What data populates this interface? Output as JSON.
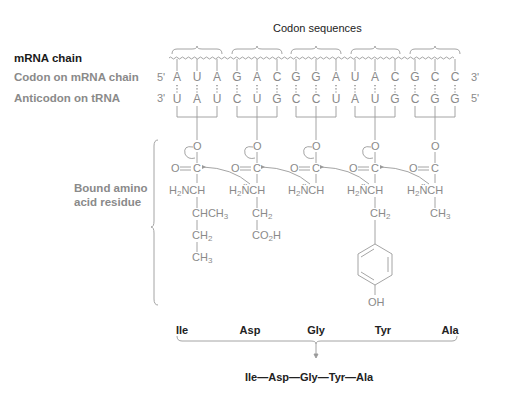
{
  "header": {
    "codon_title": "Codon sequences"
  },
  "row_labels": {
    "mrna_chain": "mRNA chain",
    "codon_on_mrna": "Codon on mRNA chain",
    "anticodon_on_trna": "Anticodon on tRNA",
    "bound_residue_line1": "Bound amino",
    "bound_residue_line2": "acid residue"
  },
  "strand_ends": {
    "mrna_left": "5'",
    "mrna_right": "3'",
    "trna_left": "3'",
    "trna_right": "5'"
  },
  "codons": [
    "AUA",
    "GAC",
    "GGA",
    "UAC",
    "GCC"
  ],
  "mrna_bases": [
    "A",
    "U",
    "A",
    "G",
    "A",
    "C",
    "G",
    "G",
    "A",
    "U",
    "A",
    "C",
    "G",
    "C",
    "C"
  ],
  "trna_bases": [
    "U",
    "A",
    "U",
    "C",
    "U",
    "G",
    "C",
    "C",
    "U",
    "A",
    "U",
    "G",
    "C",
    "G",
    "G"
  ],
  "residues": [
    {
      "name": "Ile",
      "carbonyl": "O═C",
      "alpha": "H2NCH",
      "side_chain": [
        "CHCH3",
        "CH2",
        "CH3"
      ]
    },
    {
      "name": "Asp",
      "carbonyl": "O═C",
      "alpha": "H2N̈CH",
      "side_chain": [
        "CH2",
        "CO2H"
      ]
    },
    {
      "name": "Gly",
      "carbonyl": "O═C",
      "alpha": "H2N̈CH",
      "side_chain": []
    },
    {
      "name": "Tyr",
      "carbonyl": "O═C",
      "alpha": "H2N̈CH",
      "side_chain": [
        "CH2",
        "phenol-ring",
        "OH"
      ]
    },
    {
      "name": "Ala",
      "carbonyl": "O═C",
      "alpha": "H2N̈CH",
      "side_chain": [
        "CH3"
      ]
    }
  ],
  "amino_acid_labels": [
    "Ile",
    "Asp",
    "Gly",
    "Tyr",
    "Ala"
  ],
  "peptide": {
    "sequence": [
      "Ile",
      "Asp",
      "Gly",
      "Tyr",
      "Ala"
    ],
    "text": "Ile—Asp—Gly—Tyr—Ala"
  },
  "chem_text": {
    "oxygen": "O",
    "carbon": "C",
    "oh": "OH"
  },
  "colors": {
    "line_grey": "#9a9a9a",
    "text_grey": "#8a8a8a",
    "text_dark": "#1a1a1a"
  }
}
